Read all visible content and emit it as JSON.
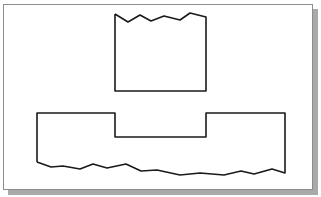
{
  "diagram": {
    "type": "technical-drawing-break-lines",
    "stroke_color": "#1a1a1a",
    "frame_border_color": "#8c8c8c",
    "shadow_color": "#a9a9a9",
    "shapes": [
      {
        "name": "upper-part-with-top-break",
        "points": "115,14 128,22 140,15 151,21 164,16 180,20 190,13 206,17 206,91 115,91 115,14"
      },
      {
        "name": "lower-part-with-bottom-break",
        "points": "37,162 37,113 115,113 115,137 206,137 206,113 285,113 285,173 272,169 254,174 241,171 224,175 200,173 180,175 157,170 141,171 126,164 107,168 93,164 80,169 63,166 51,167 37,162"
      }
    ]
  }
}
